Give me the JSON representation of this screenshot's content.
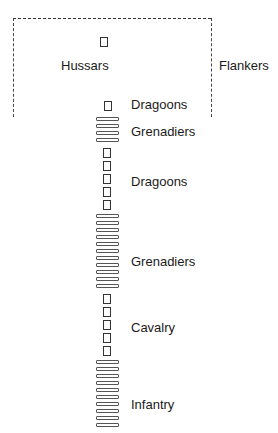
{
  "diagram": {
    "type": "military-formation-column",
    "screen_box": {
      "style": "dashed",
      "open_bottom": true
    },
    "labels": {
      "hussars": "Hussars",
      "flankers": "Flankers",
      "dragoons_1": "Dragoons",
      "grenadiers_1": "Grenadiers",
      "dragoons_2": "Dragoons",
      "grenadiers_2": "Grenadiers",
      "cavalry": "Cavalry",
      "infantry": "Infantry"
    },
    "units": [
      {
        "name": "Hussars",
        "symbol": "square",
        "count": 1
      },
      {
        "name": "Dragoons",
        "symbol": "square",
        "count": 1
      },
      {
        "name": "Grenadiers",
        "symbol": "bar",
        "count": 4
      },
      {
        "name": "Dragoons",
        "symbol": "square",
        "count": 5
      },
      {
        "name": "Grenadiers",
        "symbol": "bar",
        "count": 11
      },
      {
        "name": "Cavalry",
        "symbol": "square",
        "count": 5
      },
      {
        "name": "Infantry",
        "symbol": "bar",
        "count": 10
      }
    ],
    "legend_note": "square = cavalry squadron, bar = infantry company"
  }
}
